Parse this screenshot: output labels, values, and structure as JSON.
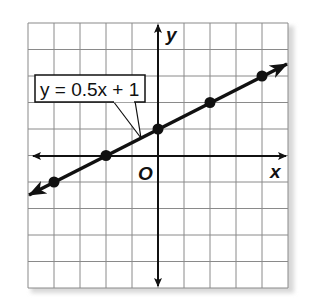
{
  "chart_data": {
    "type": "line",
    "title": "",
    "equation_label": "y = 0.5x + 1",
    "xlabel": "x",
    "ylabel": "y",
    "origin_label": "O",
    "xlim": [
      -5,
      5
    ],
    "ylim": [
      -5,
      5
    ],
    "grid": true,
    "grid_step": 1,
    "series": [
      {
        "name": "y = 0.5x + 1",
        "slope": 0.5,
        "intercept": 1,
        "arrows_both_ends": true,
        "points": [
          {
            "x": -4,
            "y": -1
          },
          {
            "x": -2,
            "y": 0
          },
          {
            "x": 0,
            "y": 1
          },
          {
            "x": 2,
            "y": 2
          },
          {
            "x": 4,
            "y": 3
          }
        ]
      }
    ],
    "colors": {
      "grid": "#8a8a8a",
      "axes": "#111111",
      "line": "#111111",
      "shadow": "#d0d0d0"
    }
  }
}
